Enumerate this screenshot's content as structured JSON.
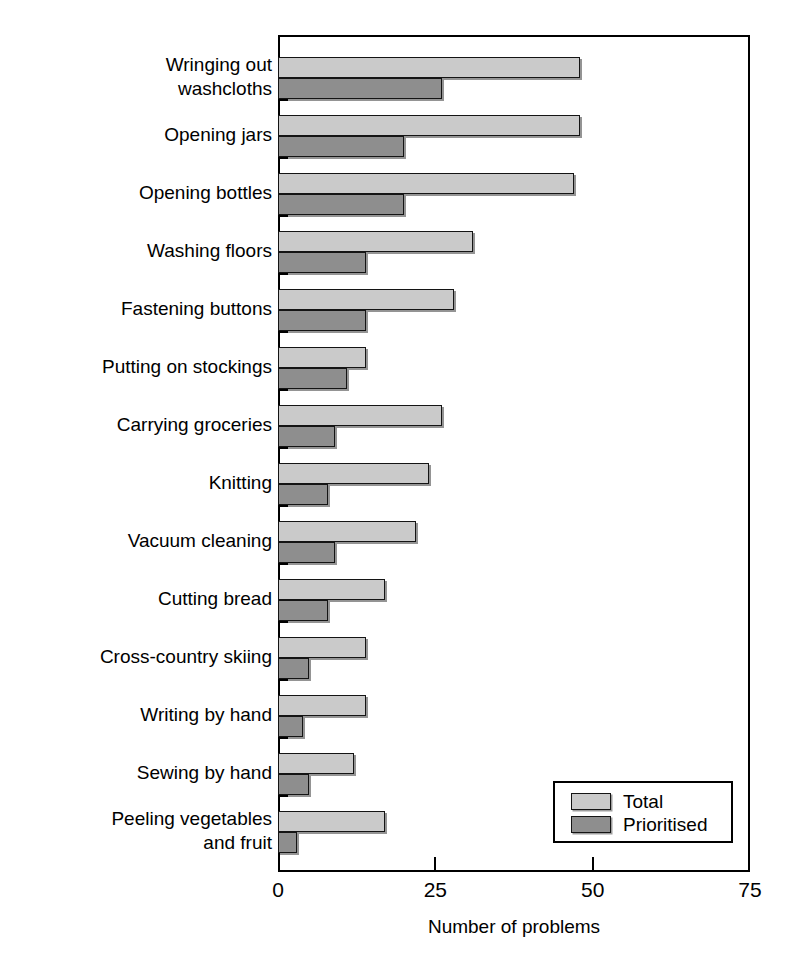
{
  "chart_data": {
    "type": "bar",
    "orientation": "horizontal",
    "title": "",
    "xlabel": "Number of problems",
    "ylabel": "Hand related activity problems",
    "xlim": [
      0,
      75
    ],
    "xticks": [
      0,
      25,
      50,
      75
    ],
    "xtick_labels": [
      "0",
      "25",
      "50",
      "75"
    ],
    "grid": false,
    "legend_position": "bottom-right",
    "categories": [
      "Wringing out\nwashcloths",
      "Opening jars",
      "Opening bottles",
      "Washing floors",
      "Fastening buttons",
      "Putting on stockings",
      "Carrying groceries",
      "Knitting",
      "Vacuum cleaning",
      "Cutting bread",
      "Cross-country skiing",
      "Writing by hand",
      "Sewing by hand",
      "Peeling vegetables\nand fruit"
    ],
    "series": [
      {
        "name": "Total",
        "color": "#cacaca",
        "values": [
          48,
          48,
          47,
          31,
          28,
          14,
          26,
          24,
          22,
          17,
          14,
          14,
          12,
          17
        ]
      },
      {
        "name": "Prioritised",
        "color": "#8e8e8e",
        "values": [
          26,
          20,
          20,
          14,
          14,
          11,
          9,
          8,
          9,
          8,
          5,
          4,
          5,
          3
        ]
      }
    ]
  },
  "legend": {
    "entries": [
      {
        "label": "Total",
        "swatch": "total"
      },
      {
        "label": "Prioritised",
        "swatch": "prioritised"
      }
    ]
  },
  "colors": {
    "total": "#cacaca",
    "prioritised": "#8e8e8e",
    "axis": "#000000",
    "background": "#ffffff"
  }
}
